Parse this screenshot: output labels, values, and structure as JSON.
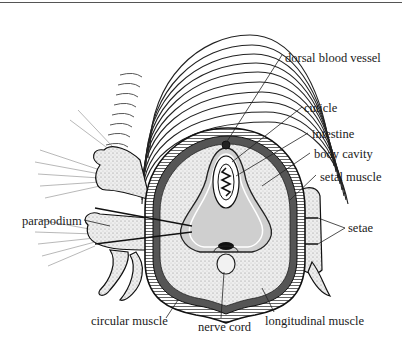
{
  "diagram": {
    "colors": {
      "ink": "#1a1a1a",
      "body_cavity_fill": "#c9c9c9",
      "stipple_fill": "#e4e4e4",
      "background": "#ffffff"
    },
    "labels": {
      "dorsal_blood_vessel": "dorsal blood vessel",
      "cuticle": "cuticle",
      "intestine": "intestine",
      "body_cavity": "body cavity",
      "setal_muscle": "setal muscle",
      "setae": "setae",
      "parapodium": "parapodium",
      "circular_muscle": "circular muscle",
      "nerve_cord": "nerve cord",
      "longitudinal_muscle": "longitudinal muscle"
    }
  }
}
